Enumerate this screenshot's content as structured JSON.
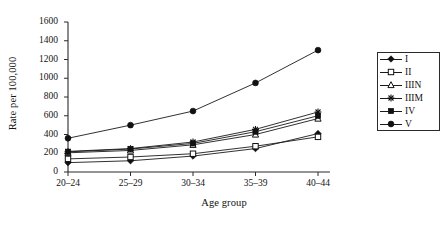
{
  "chart_data": {
    "type": "line",
    "title": "",
    "xlabel": "Age group",
    "ylabel": "Rate per 100,000",
    "categories": [
      "20–24",
      "25–29",
      "30–34",
      "35–39",
      "40–44"
    ],
    "x_tick_labels": [
      "20–24",
      "25–29",
      "30–34",
      "35–39",
      "40–44"
    ],
    "y_tick_labels": [
      "0",
      "200",
      "400",
      "600",
      "800",
      "1000",
      "1200",
      "1400",
      "1600"
    ],
    "y_ticks": [
      0,
      200,
      400,
      600,
      800,
      1000,
      1200,
      1400,
      1600
    ],
    "ylim": [
      0,
      1600
    ],
    "grid": false,
    "legend_position": "right-inside",
    "legend_entries": [
      "I",
      "II",
      "IIIN",
      "IIIM",
      "IV",
      "V"
    ],
    "series": [
      {
        "name": "I",
        "marker": "filled-diamond",
        "values": [
          100,
          120,
          170,
          250,
          410
        ]
      },
      {
        "name": "II",
        "marker": "open-square",
        "values": [
          140,
          160,
          195,
          275,
          375
        ]
      },
      {
        "name": "IIIN",
        "marker": "open-triangle",
        "values": [
          205,
          230,
          290,
          400,
          570
        ]
      },
      {
        "name": "IIIM",
        "marker": "asterisk",
        "values": [
          220,
          250,
          320,
          455,
          640
        ]
      },
      {
        "name": "IV",
        "marker": "filled-square",
        "values": [
          215,
          245,
          305,
          430,
          600
        ]
      },
      {
        "name": "V",
        "marker": "filled-circle",
        "values": [
          360,
          500,
          650,
          950,
          1300
        ]
      }
    ],
    "line_color": "#1a1a1a",
    "axis_color": "#2a2a2a"
  },
  "axes": {
    "x_title": "Age group",
    "y_title": "Rate per 100,000"
  },
  "legend": {
    "items": [
      {
        "label": "I"
      },
      {
        "label": "II"
      },
      {
        "label": "IIIN"
      },
      {
        "label": "IIIM"
      },
      {
        "label": "IV"
      },
      {
        "label": "V"
      }
    ]
  },
  "caption": {
    "text": ""
  }
}
